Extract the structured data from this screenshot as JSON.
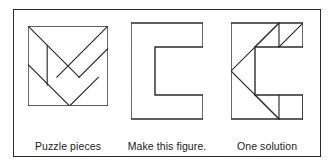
{
  "figure": {
    "kind": "tangram-puzzle-illustration",
    "border_color": "#2b2b2b",
    "line_color": "#2b2b2b",
    "background_color": "#ffffff",
    "panels": [
      {
        "id": "puzzle-pieces",
        "caption": "Puzzle pieces",
        "shape": "square",
        "description": "Tangram square divided into seven pieces"
      },
      {
        "id": "target-figure",
        "caption": "Make this figure.",
        "shape": "block-letter-C",
        "description": "Outline of a thick block letter C"
      },
      {
        "id": "one-solution",
        "caption": "One solution",
        "shape": "block-letter-C",
        "description": "Block letter C filled with the seven tangram pieces"
      }
    ]
  },
  "geometry": {
    "pieces_square": {
      "viewbox": "0 0 100 100",
      "outline": "0,0 100,0 100,100 0,100",
      "cuts": [
        "M 0 0 L 64 64",
        "M 100 0 L 36 64",
        "M 100 0 L 64 64 L 100 36",
        "M 0 50 L 50 100",
        "M 25 25 L 25 75",
        "M 25 75 L 75 75",
        "M 50 100 L 82 68"
      ]
    },
    "letter_c": {
      "viewbox": "0 0 84 112",
      "outline": "0,0 84,0 84,28 28,28 28,84 84,84 84,112 0,112"
    },
    "solution": {
      "viewbox": "0 0 84 112",
      "outline": "0,0 84,0 84,28 28,28 28,84 84,84 84,112 0,112",
      "cuts": [
        "M 0 56 L 56 0",
        "M 0 56 L 56 112",
        "M 28 28 L 56 0",
        "M 56 0 L 84 28",
        "M 56 28 L 84 0",
        "M 28 84 L 56 112",
        "M 56 84 L 56 112",
        "M 56 84 L 84 112"
      ]
    }
  }
}
